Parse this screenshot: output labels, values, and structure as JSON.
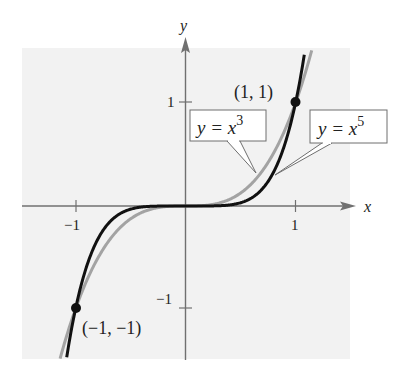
{
  "chart_data": {
    "type": "line",
    "title": "",
    "xlabel": "x",
    "ylabel": "y",
    "xlim": [
      -1.5,
      1.5
    ],
    "ylim": [
      -1.5,
      1.5
    ],
    "grid": false,
    "x_ticks": [
      {
        "value": -1,
        "label": "−1"
      },
      {
        "value": 1,
        "label": "1"
      }
    ],
    "y_ticks": [
      {
        "value": -1,
        "label": "−1"
      },
      {
        "value": 1,
        "label": "1"
      }
    ],
    "series": [
      {
        "name": "y = x^3",
        "label_base": "y = x",
        "label_exp": "3",
        "function": "x^3",
        "exponent": 3,
        "color": "#a3a3a3",
        "width": 3
      },
      {
        "name": "y = x^5",
        "label_base": "y = x",
        "label_exp": "5",
        "function": "x^5",
        "exponent": 5,
        "color": "#111111",
        "width": 3
      }
    ],
    "points": [
      {
        "x": 1,
        "y": 1,
        "label": "(1, 1)"
      },
      {
        "x": -1,
        "y": -1,
        "label": "(−1, −1)"
      }
    ],
    "colors": {
      "background": "#f2f2f2",
      "axis": "#6e6e6e",
      "text": "#222222"
    }
  }
}
